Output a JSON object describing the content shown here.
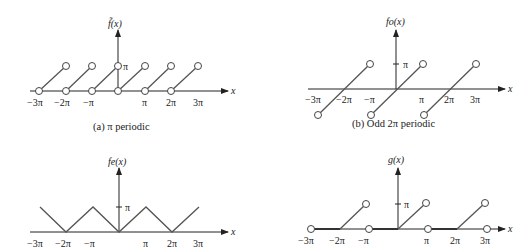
{
  "panels": {
    "a": {
      "ylabel": "f̃(x)",
      "xlabel": "x",
      "ytick": "π",
      "xticks": [
        "−3π",
        "−2π",
        "−π",
        "π",
        "2π",
        "3π"
      ],
      "caption": "(a) π periodic"
    },
    "b": {
      "ylabel": "fo(x)",
      "xlabel": "x",
      "ytick": "π",
      "xticks": [
        "−3π",
        "−2π",
        "−π",
        "π",
        "2π",
        "3π"
      ],
      "caption": "(b) Odd 2π periodic"
    },
    "c": {
      "ylabel": "fe(x)",
      "xlabel": "x",
      "ytick": "π",
      "xticks": [
        "−3π",
        "−2π",
        "−π",
        "π",
        "2π",
        "3π"
      ]
    },
    "d": {
      "ylabel": "g(x)",
      "xlabel": "x",
      "ytick": "π",
      "xticks": [
        "−3π",
        "−2π",
        "−π",
        "π",
        "2π",
        "3π"
      ]
    }
  }
}
